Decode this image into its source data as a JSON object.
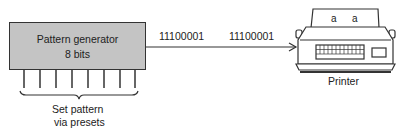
{
  "generator": {
    "title": "Pattern generator",
    "subtitle": "8 bits",
    "preset_line_count": 8,
    "preset_label_line1": "Set pattern",
    "preset_label_line2": "via presets"
  },
  "signal": {
    "byte_1": "11100001",
    "byte_2": "11100001"
  },
  "printer": {
    "label": "Printer",
    "paper_chars": [
      "a",
      "a"
    ]
  },
  "colors": {
    "box_fill": "#c4c4c4",
    "stroke": "#333333"
  }
}
